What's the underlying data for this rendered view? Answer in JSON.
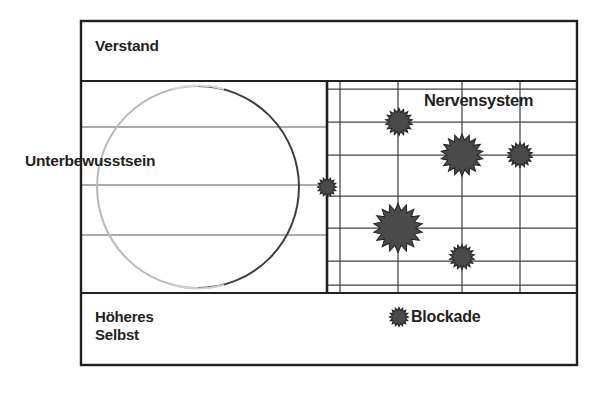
{
  "diagram": {
    "type": "conceptual-block-diagram",
    "title_text_visible": false,
    "labels": {
      "verstand": "Verstand",
      "unterbewusstsein": "Unterbewusstsein",
      "nervensystem": "Nervensystem",
      "hoeheres_selbst": "Höheres\nSelbst",
      "blockade": "Blockade"
    },
    "legend": {
      "items": [
        {
          "symbol": "burst-star-icon",
          "label": "Blockade"
        }
      ]
    },
    "colors": {
      "background": "#ffffff",
      "outer_border": "#231f20",
      "grid_line": "#4d4d4d",
      "thick_divider": "#231f20",
      "circle_stroke_dark": "#3a3a3a",
      "circle_stroke_light": "#b3b3b3",
      "star_fill": "#4a4a4a",
      "star_stroke": "#262626",
      "text": "#231f20"
    },
    "frame": {
      "x": 81,
      "y": 21,
      "width": 496,
      "height": 344,
      "border_width": 2.4
    },
    "bands": {
      "top_divider_y": 81,
      "bottom_divider_y": 293,
      "left_region_grid_y": [
        81,
        127,
        185,
        235,
        293
      ],
      "right_region_grid_y": [
        89,
        122,
        155,
        196,
        228,
        261,
        285
      ],
      "vertical_divider_x": 327,
      "right_region_columns_x": [
        327,
        340,
        398,
        462,
        520,
        577
      ]
    },
    "circle": {
      "cx": 198,
      "cy": 187,
      "r": 101,
      "stroke_width": 1.9
    },
    "stars": [
      {
        "id": "star-nerve-1",
        "cx": 399,
        "cy": 122,
        "outer_r": 13.5,
        "inner_r": 9.6,
        "points": 18
      },
      {
        "id": "star-nerve-2",
        "cx": 462,
        "cy": 155,
        "outer_r": 21.0,
        "inner_r": 15.0,
        "points": 18
      },
      {
        "id": "star-nerve-3",
        "cx": 520,
        "cy": 155,
        "outer_r": 12.5,
        "inner_r": 8.9,
        "points": 18
      },
      {
        "id": "star-boundary-4",
        "cx": 327,
        "cy": 187,
        "outer_r": 9.5,
        "inner_r": 6.8,
        "points": 16
      },
      {
        "id": "star-nerve-5",
        "cx": 398,
        "cy": 228,
        "outer_r": 24.5,
        "inner_r": 17.5,
        "points": 18
      },
      {
        "id": "star-nerve-6",
        "cx": 462,
        "cy": 257,
        "outer_r": 12.5,
        "inner_r": 8.9,
        "points": 18
      },
      {
        "id": "star-legend",
        "cx": 399,
        "cy": 317,
        "outer_r": 9.5,
        "inner_r": 6.8,
        "points": 16
      }
    ],
    "regions": [
      {
        "name": "verstand-band",
        "description": "top band labelled Verstand"
      },
      {
        "name": "unterbewusstsein-band",
        "description": "middle band with circle, labelled Unterbewusstsein"
      },
      {
        "name": "nervensystem-grid",
        "description": "right-hand gridded area labelled Nervensystem containing blockade stars"
      },
      {
        "name": "hoeheres-selbst-band",
        "description": "bottom band labelled Höheres Selbst, contains legend"
      }
    ]
  }
}
